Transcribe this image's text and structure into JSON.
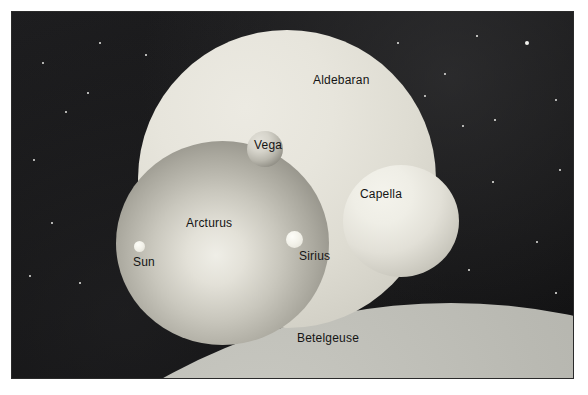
{
  "figure": {
    "background_color": "#ffffff",
    "sky_color": "#161616"
  },
  "labels": {
    "aldebaran": "Aldebaran",
    "vega": "Vega",
    "capella": "Capella",
    "arcturus": "Arcturus",
    "sirius": "Sirius",
    "sun": "Sun",
    "betelgeuse": "Betelgeuse"
  },
  "chart_data": {
    "type": "scatter",
    "xlabel": "",
    "ylabel": "",
    "legend": "none",
    "grid": false,
    "note": "Nested circles drawn to scale showing the relative diameters of seven stars against a black star field.",
    "categories": [
      "Betelgeuse",
      "Aldebaran",
      "Arcturus",
      "Capella",
      "Vega",
      "Sirius",
      "Sun"
    ],
    "series": [
      {
        "name": "apparent drawn radius (px)",
        "values": [
          590,
          149,
          106,
          58,
          18,
          8,
          5
        ]
      }
    ],
    "points": [
      {
        "label": "Betelgeuse",
        "center_x": 440,
        "center_y": 882,
        "radius": 590,
        "fill": "#a9a9a3",
        "label_x": 286,
        "label_y": 321
      },
      {
        "label": "Aldebaran",
        "center_x": 276,
        "center_y": 168,
        "radius": 149,
        "fill": "#e0ded4",
        "label_x": 302,
        "label_y": 63
      },
      {
        "label": "Arcturus",
        "center_x": 211,
        "center_y": 232,
        "radius": 106,
        "fill": "#b6b4aa",
        "label_x": 175,
        "label_y": 206
      },
      {
        "label": "Capella",
        "center_x": 390,
        "center_y": 210,
        "radius": 58,
        "fill": "#e4e2d9",
        "label_x": 349,
        "label_y": 177
      },
      {
        "label": "Vega",
        "center_x": 254,
        "center_y": 138,
        "radius": 18,
        "fill": "#b9b7ad",
        "label_x": 243,
        "label_y": 128
      },
      {
        "label": "Sirius",
        "center_x": 283,
        "center_y": 228,
        "radius": 8,
        "fill": "#f3f2ea",
        "label_x": 288,
        "label_y": 239
      },
      {
        "label": "Sun",
        "center_x": 128,
        "center_y": 235,
        "radius": 5,
        "fill": "#f2f1e9",
        "label_x": 122,
        "label_y": 245
      }
    ],
    "background_stars": [
      {
        "x": 527,
        "y": 43,
        "r": 2.2
      },
      {
        "x": 477,
        "y": 36,
        "r": 1.1
      },
      {
        "x": 495,
        "y": 120,
        "r": 1.1
      },
      {
        "x": 463,
        "y": 126,
        "r": 0.9
      },
      {
        "x": 560,
        "y": 170,
        "r": 1.0
      },
      {
        "x": 493,
        "y": 182,
        "r": 1.1
      },
      {
        "x": 556,
        "y": 100,
        "r": 0.9
      },
      {
        "x": 445,
        "y": 74,
        "r": 0.9
      },
      {
        "x": 537,
        "y": 242,
        "r": 0.9
      },
      {
        "x": 469,
        "y": 270,
        "r": 1.0
      },
      {
        "x": 556,
        "y": 293,
        "r": 1.1
      },
      {
        "x": 524,
        "y": 330,
        "r": 0.9
      },
      {
        "x": 43,
        "y": 63,
        "r": 0.9
      },
      {
        "x": 66,
        "y": 112,
        "r": 1.0
      },
      {
        "x": 34,
        "y": 160,
        "r": 0.9
      },
      {
        "x": 88,
        "y": 93,
        "r": 0.8
      },
      {
        "x": 52,
        "y": 223,
        "r": 1.0
      },
      {
        "x": 30,
        "y": 276,
        "r": 0.9
      },
      {
        "x": 80,
        "y": 283,
        "r": 0.8
      },
      {
        "x": 100,
        "y": 43,
        "r": 0.8
      },
      {
        "x": 146,
        "y": 55,
        "r": 0.8
      },
      {
        "x": 398,
        "y": 43,
        "r": 0.8
      },
      {
        "x": 425,
        "y": 96,
        "r": 0.9
      },
      {
        "x": 440,
        "y": 330,
        "r": 0.9
      },
      {
        "x": 350,
        "y": 300,
        "r": 0.8
      }
    ]
  }
}
